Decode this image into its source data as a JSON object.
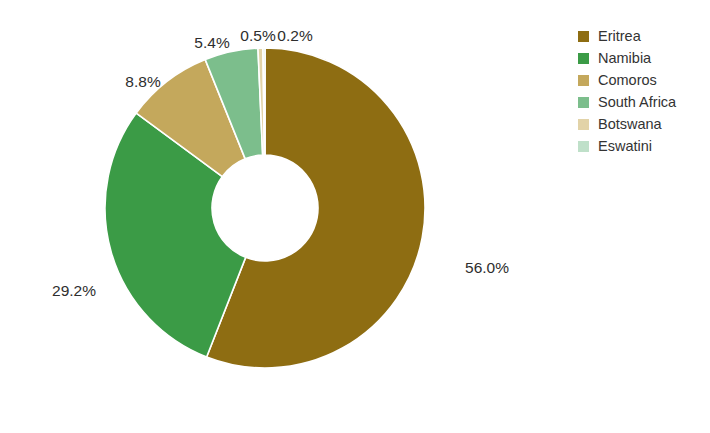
{
  "chart_data": {
    "type": "pie",
    "variant": "donut",
    "title": "",
    "subtitle": "",
    "xlabel": "",
    "ylabel": "",
    "grid": false,
    "legend_position": "right",
    "hole_ratio": 0.33,
    "start_angle_deg": -90,
    "direction": "clockwise",
    "labels_format": "percent_one_decimal",
    "categories": [
      "Eritrea",
      "Namibia",
      "Comoros",
      "South Africa",
      "Botswana",
      "Eswatini"
    ],
    "values": [
      56.0,
      29.2,
      8.8,
      5.4,
      0.5,
      0.2
    ],
    "colors": [
      "#8E6D12",
      "#3B9B46",
      "#C1A košili",
      "#7CBE8C",
      "#E2D3A8",
      "#BFE0C9"
    ],
    "slices": [
      {
        "name": "Eritrea",
        "value": 56.0,
        "label": "56.0%",
        "color": "#8E6D12",
        "label_x": 487,
        "label_y": 269
      },
      {
        "name": "Namibia",
        "value": 29.2,
        "label": "29.2%",
        "color": "#3B9B46",
        "label_x": 74,
        "label_y": 292
      },
      {
        "name": "Comoros",
        "value": 8.8,
        "label": "8.8%",
        "color": "#C4A85C",
        "label_x": 143,
        "label_y": 83
      },
      {
        "name": "South Africa",
        "value": 5.4,
        "label": "5.4%",
        "color": "#7CBE8C",
        "label_x": 212,
        "label_y": 44
      },
      {
        "name": "Botswana",
        "value": 0.5,
        "label": "0.5%",
        "color": "#E2D3A8",
        "label_x": 258,
        "label_y": 37
      },
      {
        "name": "Eswatini",
        "value": 0.2,
        "label": "0.2%",
        "color": "#BFE0C9",
        "label_x": 295,
        "label_y": 37
      }
    ]
  },
  "legend": {
    "items": [
      {
        "label": "Eritrea",
        "color": "#8E6D12"
      },
      {
        "label": "Namibia",
        "color": "#3B9B46"
      },
      {
        "label": "Comoros",
        "color": "#C4A85C"
      },
      {
        "label": "South Africa",
        "color": "#7CBE8C"
      },
      {
        "label": "Botswana",
        "color": "#E2D3A8"
      },
      {
        "label": "Eswatini",
        "color": "#BFE0C9"
      }
    ]
  },
  "geometry": {
    "center_x": 265,
    "center_y": 208,
    "outer_radius": 160,
    "inner_radius": 53
  }
}
